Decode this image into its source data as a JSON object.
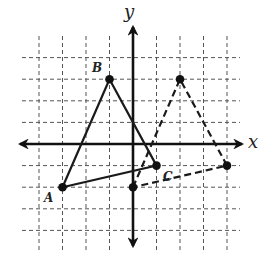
{
  "diagram": {
    "type": "coordinate-plane-translation",
    "axes": {
      "x_label": "x",
      "y_label": "y"
    },
    "grid": {
      "x_range": [
        -4,
        4
      ],
      "y_range": [
        -4,
        4
      ],
      "style": "dashed"
    },
    "original_triangle": {
      "style": "solid",
      "vertices": [
        {
          "name": "A",
          "label": "A",
          "x": -3,
          "y": -2
        },
        {
          "name": "B",
          "label": "B",
          "x": -1,
          "y": 3
        },
        {
          "name": "C",
          "label": "C",
          "x": 1,
          "y": -1
        }
      ]
    },
    "image_triangle": {
      "style": "dashed",
      "vertices": [
        {
          "name": "A'",
          "label": "",
          "x": 0,
          "y": -2
        },
        {
          "name": "B'",
          "label": "",
          "x": 2,
          "y": 3
        },
        {
          "name": "C'",
          "label": "",
          "x": 4,
          "y": -1
        }
      ]
    },
    "colors": {
      "ink": "#111111",
      "grid": "#555555",
      "background": "#ffffff"
    }
  }
}
